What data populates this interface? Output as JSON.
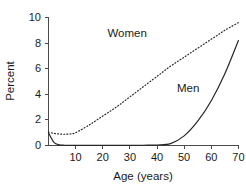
{
  "chart_data": {
    "type": "line",
    "title": "",
    "xlabel": "Age (years)",
    "ylabel": "Percent",
    "xlim": [
      0,
      70
    ],
    "ylim": [
      0,
      10
    ],
    "grid": false,
    "legend_position": "inline-annotations",
    "xticks": [
      10,
      20,
      30,
      40,
      50,
      60,
      70
    ],
    "xtick_labels": [
      "10",
      "20",
      "30",
      "40",
      "50",
      "60",
      "70"
    ],
    "yticks": [
      0,
      2,
      4,
      6,
      8,
      10
    ],
    "ytick_labels": [
      "0",
      "2",
      "4",
      "6",
      "8",
      "10"
    ],
    "x": [
      0,
      2,
      4,
      6,
      8,
      10,
      15,
      20,
      25,
      30,
      35,
      40,
      45,
      50,
      55,
      60,
      65,
      70
    ],
    "series": [
      {
        "name": "Women",
        "style": "dotted",
        "color": "#262626",
        "values": [
          1.05,
          0.95,
          0.9,
          0.88,
          0.9,
          1.0,
          1.6,
          2.3,
          3.0,
          3.8,
          4.6,
          5.4,
          6.2,
          6.9,
          7.6,
          8.3,
          9.0,
          9.6
        ],
        "annotation": {
          "text": "Women",
          "x": 29,
          "y": 8.45
        }
      },
      {
        "name": "Men",
        "style": "solid",
        "color": "#262626",
        "values": [
          1.0,
          0.25,
          0.05,
          0.02,
          0.01,
          0.01,
          0.01,
          0.01,
          0.01,
          0.01,
          0.02,
          0.04,
          0.15,
          0.75,
          1.9,
          3.5,
          5.6,
          8.2
        ],
        "annotation": {
          "text": "Men",
          "x": 51.5,
          "y": 4.2
        }
      }
    ]
  }
}
